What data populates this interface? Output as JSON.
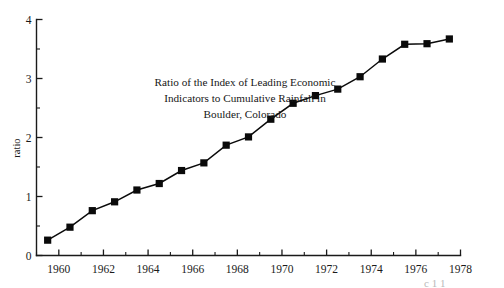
{
  "chart_data": {
    "type": "line",
    "title": "Ratio of the Index of Leading Economic Indicators to Cumulative Rainfall in Boulder, Colorado",
    "title_lines": [
      "Ratio of the Index of Leading Economic",
      "Indicators to Cumulative Rainfall in",
      "Boulder, Colorado"
    ],
    "xlabel": "",
    "ylabel": "ratio",
    "xlim": [
      1959,
      1978
    ],
    "ylim": [
      0,
      4
    ],
    "x_major_ticks": [
      1960,
      1962,
      1964,
      1966,
      1968,
      1970,
      1972,
      1974,
      1976,
      1978
    ],
    "x_major_tick_labels": [
      "1960",
      "1962",
      "1964",
      "1966",
      "1968",
      "1970",
      "1972",
      "1974",
      "1976",
      "1978"
    ],
    "x_minor_ticks": [
      1959,
      1961,
      1963,
      1965,
      1967,
      1969,
      1971,
      1973,
      1975,
      1977
    ],
    "y_major_ticks": [
      0,
      1,
      2,
      3,
      4
    ],
    "y_major_tick_labels": [
      "0",
      "1",
      "2",
      "3",
      "4"
    ],
    "y_minor_ticks": [
      0.5,
      1.5,
      2.5,
      3.5
    ],
    "grid": false,
    "legend": false,
    "marker": "filled-square",
    "marker_color": "#0a0a0a",
    "line_color": "#0a0a0a",
    "x": [
      1959.5,
      1960.5,
      1961.5,
      1962.5,
      1963.5,
      1964.5,
      1965.5,
      1966.5,
      1967.5,
      1968.5,
      1969.5,
      1970.5,
      1971.5,
      1972.5,
      1973.5,
      1974.5,
      1975.5,
      1976.5,
      1977.5
    ],
    "values": [
      0.26,
      0.48,
      0.76,
      0.91,
      1.11,
      1.22,
      1.44,
      1.57,
      1.87,
      2.01,
      2.31,
      2.58,
      2.71,
      2.82,
      3.03,
      3.33,
      3.58,
      3.59,
      3.67
    ],
    "series": [
      {
        "name": "ratio",
        "x": [
          1959.5,
          1960.5,
          1961.5,
          1962.5,
          1963.5,
          1964.5,
          1965.5,
          1966.5,
          1967.5,
          1968.5,
          1969.5,
          1970.5,
          1971.5,
          1972.5,
          1973.5,
          1974.5,
          1975.5,
          1976.5,
          1977.5
        ],
        "values": [
          0.26,
          0.48,
          0.76,
          0.91,
          1.11,
          1.22,
          1.44,
          1.57,
          1.87,
          2.01,
          2.31,
          2.58,
          2.71,
          2.82,
          3.03,
          3.33,
          3.58,
          3.59,
          3.67
        ]
      }
    ]
  },
  "page": {
    "background": "#ffffff",
    "ink": "#0a0a0a",
    "edge_artifact": "c 1 1"
  }
}
